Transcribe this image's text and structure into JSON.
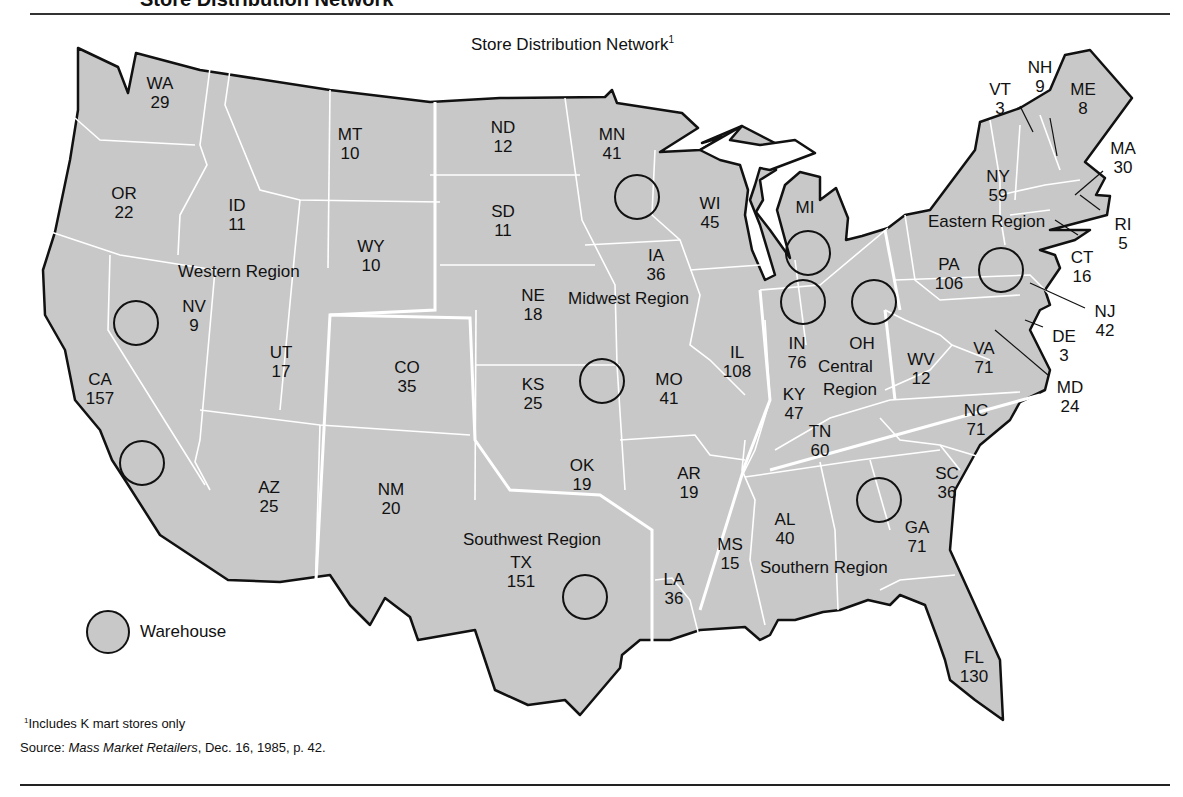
{
  "header": {
    "title": "Store Distribution Network"
  },
  "map": {
    "title": "Store Distribution Network",
    "title_footnote_mark": "1",
    "fill_color": "#c8c8c8",
    "border_color": "#111111",
    "internal_border_color": "#ffffff"
  },
  "states": [
    {
      "abbr": "WA",
      "stores": "29"
    },
    {
      "abbr": "OR",
      "stores": "22"
    },
    {
      "abbr": "CA",
      "stores": "157"
    },
    {
      "abbr": "ID",
      "stores": "11"
    },
    {
      "abbr": "NV",
      "stores": "9"
    },
    {
      "abbr": "MT",
      "stores": "10"
    },
    {
      "abbr": "WY",
      "stores": "10"
    },
    {
      "abbr": "UT",
      "stores": "17"
    },
    {
      "abbr": "AZ",
      "stores": "25"
    },
    {
      "abbr": "CO",
      "stores": "35"
    },
    {
      "abbr": "NM",
      "stores": "20"
    },
    {
      "abbr": "ND",
      "stores": "12"
    },
    {
      "abbr": "SD",
      "stores": "11"
    },
    {
      "abbr": "NE",
      "stores": "18"
    },
    {
      "abbr": "KS",
      "stores": "25"
    },
    {
      "abbr": "OK",
      "stores": "19"
    },
    {
      "abbr": "TX",
      "stores": "151"
    },
    {
      "abbr": "MN",
      "stores": "41"
    },
    {
      "abbr": "IA",
      "stores": "36"
    },
    {
      "abbr": "MO",
      "stores": "41"
    },
    {
      "abbr": "AR",
      "stores": "19"
    },
    {
      "abbr": "LA",
      "stores": "36"
    },
    {
      "abbr": "WI",
      "stores": "45"
    },
    {
      "abbr": "IL",
      "stores": "108"
    },
    {
      "abbr": "MI",
      "stores": ""
    },
    {
      "abbr": "IN",
      "stores": "76"
    },
    {
      "abbr": "OH",
      "stores": ""
    },
    {
      "abbr": "KY",
      "stores": "47"
    },
    {
      "abbr": "TN",
      "stores": "60"
    },
    {
      "abbr": "MS",
      "stores": "15"
    },
    {
      "abbr": "AL",
      "stores": "40"
    },
    {
      "abbr": "GA",
      "stores": "71"
    },
    {
      "abbr": "FL",
      "stores": "130"
    },
    {
      "abbr": "SC",
      "stores": "36"
    },
    {
      "abbr": "NC",
      "stores": "71"
    },
    {
      "abbr": "VA",
      "stores": "71"
    },
    {
      "abbr": "WV",
      "stores": "12"
    },
    {
      "abbr": "PA",
      "stores": "106"
    },
    {
      "abbr": "NY",
      "stores": "59"
    },
    {
      "abbr": "VT",
      "stores": "3"
    },
    {
      "abbr": "NH",
      "stores": "9"
    },
    {
      "abbr": "ME",
      "stores": "8"
    },
    {
      "abbr": "MA",
      "stores": "30"
    },
    {
      "abbr": "RI",
      "stores": "5"
    },
    {
      "abbr": "CT",
      "stores": "16"
    },
    {
      "abbr": "NJ",
      "stores": "42"
    },
    {
      "abbr": "DE",
      "stores": "3"
    },
    {
      "abbr": "MD",
      "stores": "24"
    }
  ],
  "regions": [
    {
      "name": "Western Region"
    },
    {
      "name": "Midwest Region"
    },
    {
      "name": "Central Region"
    },
    {
      "name": "Eastern Region"
    },
    {
      "name": "Southwest Region"
    },
    {
      "name": "Southern Region"
    }
  ],
  "warehouses": [
    {
      "location": "NV/CA north"
    },
    {
      "location": "CA south"
    },
    {
      "location": "MN"
    },
    {
      "location": "KS/MO"
    },
    {
      "location": "TX"
    },
    {
      "location": "MI"
    },
    {
      "location": "IN"
    },
    {
      "location": "OH"
    },
    {
      "location": "PA"
    },
    {
      "location": "GA"
    }
  ],
  "legend": {
    "label": "Warehouse"
  },
  "footnote": {
    "mark": "1",
    "text": "Includes K mart stores only"
  },
  "source": {
    "prefix": "Source: ",
    "publication": "Mass Market Retailers",
    "suffix": ", Dec. 16, 1985, p. 42."
  }
}
